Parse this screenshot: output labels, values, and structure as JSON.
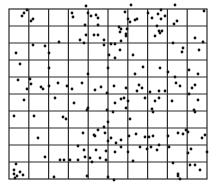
{
  "figure": {
    "type": "quadrat-grid-point-pattern",
    "grid": {
      "columns": 10,
      "rows": 10,
      "left": 9,
      "top": 9,
      "right": 207,
      "bottom": 179,
      "line_color": "#2a2a2a",
      "line_width": 1.2
    },
    "point_color": "#111111",
    "point_radius": 1.4,
    "points": [
      [
        27,
        10
      ],
      [
        24,
        13
      ],
      [
        22,
        16
      ],
      [
        33,
        19
      ],
      [
        31,
        21
      ],
      [
        72,
        13
      ],
      [
        73,
        17
      ],
      [
        86,
        6
      ],
      [
        88,
        13
      ],
      [
        91,
        16
      ],
      [
        98,
        18
      ],
      [
        98,
        25
      ],
      [
        96,
        15
      ],
      [
        125,
        12
      ],
      [
        128,
        19
      ],
      [
        130,
        22
      ],
      [
        131,
        5
      ],
      [
        135,
        20
      ],
      [
        137,
        19
      ],
      [
        158,
        14
      ],
      [
        161,
        10
      ],
      [
        165,
        16
      ],
      [
        161,
        19
      ],
      [
        175,
        5
      ],
      [
        174,
        24
      ],
      [
        177,
        21
      ],
      [
        204,
        11
      ],
      [
        85,
        25
      ],
      [
        94,
        35
      ],
      [
        98,
        35
      ],
      [
        80,
        40
      ],
      [
        84,
        43
      ],
      [
        86,
        35
      ],
      [
        104,
        40
      ],
      [
        115,
        44
      ],
      [
        121,
        29
      ],
      [
        120,
        32
      ],
      [
        119,
        27
      ],
      [
        126,
        36
      ],
      [
        127,
        29
      ],
      [
        121,
        41
      ],
      [
        148,
        13
      ],
      [
        152,
        18
      ],
      [
        157,
        26
      ],
      [
        160,
        33
      ],
      [
        159,
        31
      ],
      [
        162,
        31
      ],
      [
        155,
        36
      ],
      [
        195,
        38
      ],
      [
        203,
        42
      ],
      [
        59,
        42
      ],
      [
        33,
        45
      ],
      [
        45,
        46
      ],
      [
        16,
        53
      ],
      [
        20,
        64
      ],
      [
        49,
        53
      ],
      [
        49,
        68
      ],
      [
        104,
        45
      ],
      [
        111,
        44
      ],
      [
        126,
        34
      ],
      [
        120,
        50
      ],
      [
        109,
        55
      ],
      [
        115,
        58
      ],
      [
        173,
        43
      ],
      [
        182,
        52
      ],
      [
        183,
        48
      ],
      [
        199,
        50
      ],
      [
        189,
        70
      ],
      [
        198,
        74
      ],
      [
        133,
        55
      ],
      [
        143,
        67
      ],
      [
        139,
        85
      ],
      [
        135,
        74
      ],
      [
        108,
        68
      ],
      [
        88,
        74
      ],
      [
        160,
        68
      ],
      [
        168,
        72
      ],
      [
        175,
        77
      ],
      [
        176,
        83
      ],
      [
        195,
        85
      ],
      [
        192,
        88
      ],
      [
        18,
        80
      ],
      [
        30,
        79
      ],
      [
        31,
        84
      ],
      [
        41,
        87
      ],
      [
        49,
        86
      ],
      [
        58,
        83
      ],
      [
        67,
        86
      ],
      [
        27,
        89
      ],
      [
        43,
        89
      ],
      [
        72,
        89
      ],
      [
        82,
        83
      ],
      [
        95,
        90
      ],
      [
        101,
        87
      ],
      [
        107,
        93
      ],
      [
        114,
        86
      ],
      [
        126,
        88
      ],
      [
        137,
        91
      ],
      [
        142,
        88
      ],
      [
        150,
        92
      ],
      [
        159,
        91
      ],
      [
        165,
        91
      ],
      [
        180,
        86
      ],
      [
        189,
        94
      ],
      [
        24,
        100
      ],
      [
        55,
        98
      ],
      [
        74,
        103
      ],
      [
        14,
        116
      ],
      [
        34,
        116
      ],
      [
        63,
        117
      ],
      [
        66,
        119
      ],
      [
        87,
        110
      ],
      [
        88,
        108
      ],
      [
        107,
        110
      ],
      [
        115,
        103
      ],
      [
        108,
        122
      ],
      [
        113,
        112
      ],
      [
        124,
        98
      ],
      [
        121,
        99
      ],
      [
        126,
        108
      ],
      [
        128,
        101
      ],
      [
        130,
        119
      ],
      [
        145,
        98
      ],
      [
        159,
        98
      ],
      [
        155,
        101
      ],
      [
        152,
        109
      ],
      [
        153,
        112
      ],
      [
        172,
        101
      ],
      [
        198,
        100
      ],
      [
        194,
        110
      ],
      [
        195,
        112
      ],
      [
        38,
        138
      ],
      [
        98,
        130
      ],
      [
        104,
        127
      ],
      [
        105,
        133
      ],
      [
        94,
        135
      ],
      [
        95,
        136
      ],
      [
        83,
        133
      ],
      [
        108,
        141
      ],
      [
        111,
        138
      ],
      [
        116,
        143
      ],
      [
        121,
        140
      ],
      [
        129,
        136
      ],
      [
        136,
        134
      ],
      [
        145,
        137
      ],
      [
        149,
        137
      ],
      [
        153,
        136
      ],
      [
        168,
        136
      ],
      [
        178,
        133
      ],
      [
        205,
        135
      ],
      [
        202,
        138
      ],
      [
        183,
        134
      ],
      [
        186,
        130
      ],
      [
        188,
        132
      ],
      [
        78,
        146
      ],
      [
        84,
        150
      ],
      [
        96,
        150
      ],
      [
        106,
        151
      ],
      [
        121,
        147
      ],
      [
        115,
        152
      ],
      [
        128,
        152
      ],
      [
        140,
        147
      ],
      [
        147,
        149
      ],
      [
        151,
        147
      ],
      [
        157,
        150
      ],
      [
        159,
        145
      ],
      [
        169,
        147
      ],
      [
        191,
        149
      ],
      [
        188,
        153
      ],
      [
        195,
        165
      ],
      [
        207,
        152
      ],
      [
        45,
        157
      ],
      [
        60,
        160
      ],
      [
        64,
        160
      ],
      [
        70,
        160
      ],
      [
        78,
        160
      ],
      [
        85,
        157
      ],
      [
        90,
        158
      ],
      [
        100,
        158
      ],
      [
        106,
        160
      ],
      [
        92,
        162
      ],
      [
        133,
        161
      ],
      [
        16,
        164
      ],
      [
        14,
        170
      ],
      [
        14,
        174
      ],
      [
        17,
        176
      ],
      [
        20,
        172
      ],
      [
        23,
        175
      ],
      [
        15,
        178
      ],
      [
        54,
        177
      ],
      [
        87,
        176
      ],
      [
        108,
        177
      ],
      [
        114,
        180
      ],
      [
        178,
        176
      ],
      [
        180,
        179
      ],
      [
        173,
        163
      ],
      [
        200,
        170
      ],
      [
        190,
        165
      ],
      [
        178,
        174
      ]
    ]
  }
}
